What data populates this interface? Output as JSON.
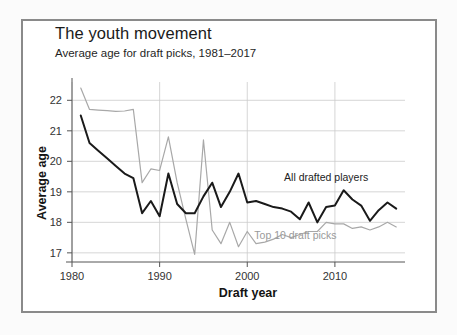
{
  "figure": {
    "title": "The youth movement",
    "subtitle": "Average age for draft picks, 1981–2017",
    "frame_color": "#8a8a8a",
    "background": "#ffffff"
  },
  "chart_data": {
    "type": "line",
    "title": "The youth movement",
    "subtitle": "Average age for draft picks, 1981–2017",
    "xlabel": "Draft year",
    "ylabel": "Average age",
    "xlim": [
      1980,
      2018
    ],
    "ylim": [
      16.7,
      22.6
    ],
    "xticks": [
      1980,
      1990,
      2000,
      2010
    ],
    "yticks": [
      17,
      18,
      19,
      20,
      21,
      22
    ],
    "grid": true,
    "grid_color": "#cccccc",
    "legend": "annotations-inline",
    "x": [
      1981,
      1982,
      1983,
      1984,
      1985,
      1986,
      1987,
      1988,
      1989,
      1990,
      1991,
      1992,
      1993,
      1994,
      1995,
      1996,
      1997,
      1998,
      1999,
      2000,
      2001,
      2002,
      2003,
      2004,
      2005,
      2006,
      2007,
      2008,
      2009,
      2010,
      2011,
      2012,
      2013,
      2014,
      2015,
      2016,
      2017
    ],
    "series": [
      {
        "name": "All drafted players",
        "color": "#1a1a1a",
        "label_x": 2009,
        "label_y": 19.35,
        "values": [
          21.5,
          20.6,
          20.35,
          20.1,
          19.85,
          19.6,
          19.45,
          18.3,
          18.7,
          18.2,
          19.6,
          18.6,
          18.3,
          18.3,
          18.85,
          19.3,
          18.5,
          19.0,
          19.6,
          18.65,
          18.7,
          18.6,
          18.5,
          18.45,
          18.35,
          18.1,
          18.65,
          18.0,
          18.5,
          18.55,
          19.05,
          18.75,
          18.55,
          18.05,
          18.4,
          18.65,
          18.45
        ]
      },
      {
        "name": "Top 10 draft picks",
        "color": "#a8a8a8",
        "label_x": 2005.5,
        "label_y": 17.45,
        "values": [
          22.4,
          21.7,
          21.68,
          21.66,
          21.64,
          21.65,
          21.7,
          19.3,
          19.75,
          19.7,
          20.8,
          19.3,
          18.1,
          16.95,
          20.7,
          17.75,
          17.3,
          18.0,
          17.2,
          17.7,
          17.3,
          17.35,
          17.45,
          17.6,
          17.5,
          17.6,
          17.7,
          17.7,
          18.0,
          17.95,
          17.95,
          17.8,
          17.85,
          17.75,
          17.85,
          18.0,
          17.85
        ]
      }
    ]
  },
  "axes": {
    "y_title": "Average age",
    "x_title": "Draft year",
    "y_tick_labels": [
      "22",
      "21",
      "20",
      "19",
      "18",
      "17"
    ],
    "x_tick_labels": [
      "1980",
      "1990",
      "2000",
      "2010"
    ]
  }
}
